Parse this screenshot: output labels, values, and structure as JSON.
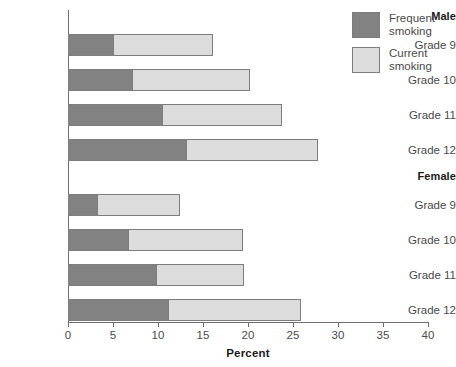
{
  "chart_data": {
    "type": "bar",
    "orientation": "horizontal",
    "stacked": true,
    "title": "",
    "xlabel": "Percent",
    "ylabel": "",
    "xlim": [
      0,
      40
    ],
    "xticks": [
      0,
      5,
      10,
      15,
      20,
      25,
      30,
      35,
      40
    ],
    "xtick_labels": [
      "0",
      "5",
      "10",
      "15",
      "20",
      "25",
      "30",
      "35",
      "40"
    ],
    "grid": false,
    "legend_position": "top-right",
    "series": [
      {
        "name": "Frequent smoking",
        "color": "#828282",
        "values": [
          5.0,
          7.1,
          10.4,
          13.1,
          3.2,
          6.7,
          9.8,
          11.1
        ]
      },
      {
        "name": "Current smoking",
        "color": "#dcdcdc",
        "values": [
          11.1,
          13.1,
          13.4,
          14.7,
          9.2,
          12.7,
          9.8,
          14.8
        ]
      }
    ],
    "totals": [
      16.1,
      20.2,
      23.8,
      27.8,
      12.4,
      19.4,
      19.6,
      25.9
    ],
    "groups": [
      {
        "label": "Male",
        "rows": [
          {
            "label": "Grade 9",
            "frequent": 5.0,
            "total": 16.1
          },
          {
            "label": "Grade 10",
            "frequent": 7.1,
            "total": 20.2
          },
          {
            "label": "Grade 11",
            "frequent": 10.4,
            "total": 23.8
          },
          {
            "label": "Grade 12",
            "frequent": 13.1,
            "total": 27.8
          }
        ]
      },
      {
        "label": "Female",
        "rows": [
          {
            "label": "Grade 9",
            "frequent": 3.2,
            "total": 12.4
          },
          {
            "label": "Grade 10",
            "frequent": 6.7,
            "total": 19.4
          },
          {
            "label": "Grade 11",
            "frequent": 9.8,
            "total": 19.6
          },
          {
            "label": "Grade 12",
            "frequent": 11.1,
            "total": 25.9
          }
        ]
      }
    ]
  },
  "legend": {
    "entries": [
      {
        "line1": "Frequent",
        "line2": "smoking",
        "color": "#828282",
        "swatch_name": "legend-swatch-frequent"
      },
      {
        "line1": "Current",
        "line2": "smoking",
        "color": "#dcdcdc",
        "swatch_name": "legend-swatch-current"
      }
    ]
  },
  "axis": {
    "x_title": "Percent",
    "ticks": [
      "0",
      "5",
      "10",
      "15",
      "20",
      "25",
      "30",
      "35",
      "40"
    ]
  },
  "labels": {
    "group_male": "Male",
    "group_female": "Female",
    "male_grade_9": "Grade 9",
    "male_grade_10": "Grade 10",
    "male_grade_11": "Grade 11",
    "male_grade_12": "Grade 12",
    "female_grade_9": "Grade 9",
    "female_grade_10": "Grade 10",
    "female_grade_11": "Grade 11",
    "female_grade_12": "Grade 12"
  },
  "colors": {
    "frequent": "#828282",
    "current": "#dcdcdc",
    "axis": "#6e6e6e",
    "text": "#4a4a4a",
    "heading": "#1a1a1a",
    "background": "#ffffff"
  }
}
